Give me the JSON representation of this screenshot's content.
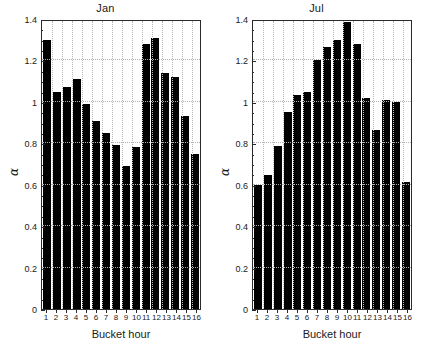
{
  "chart_data": [
    {
      "type": "bar",
      "title": "Jan",
      "xlabel": "Bucket hour",
      "ylabel": "α",
      "categories": [
        "1",
        "2",
        "3",
        "4",
        "5",
        "6",
        "7",
        "8",
        "9",
        "10",
        "11",
        "12",
        "13",
        "14",
        "15",
        "16"
      ],
      "values": [
        1.3,
        1.05,
        1.07,
        1.11,
        0.99,
        0.91,
        0.85,
        0.79,
        0.69,
        0.78,
        1.28,
        1.31,
        1.14,
        1.12,
        0.93,
        0.75
      ],
      "ylim": [
        0,
        1.4
      ],
      "yticks": [
        0,
        0.2,
        0.4,
        0.6,
        0.8,
        1,
        1.2,
        1.4
      ],
      "ytick_labels": [
        "0",
        "0.2",
        "0.4",
        "0.6",
        "0.8",
        "1",
        "1.2",
        "1.4"
      ],
      "grid": true,
      "legend": "none",
      "bar_color": "#000000"
    },
    {
      "type": "bar",
      "title": "Jul",
      "xlabel": "Bucket hour",
      "ylabel": "α",
      "categories": [
        "1",
        "2",
        "3",
        "4",
        "5",
        "6",
        "7",
        "8",
        "9",
        "10",
        "11",
        "12",
        "13",
        "14",
        "15",
        "16"
      ],
      "values": [
        0.6,
        0.645,
        0.785,
        0.95,
        1.035,
        1.05,
        1.2,
        1.265,
        1.3,
        1.385,
        1.28,
        1.02,
        0.865,
        1.01,
        1.0,
        0.615
      ],
      "ylim": [
        0,
        1.4
      ],
      "yticks": [
        0,
        0.2,
        0.4,
        0.6,
        0.8,
        1,
        1.2,
        1.4
      ],
      "ytick_labels": [
        "0",
        "0.2",
        "0.4",
        "0.6",
        "0.8",
        "1",
        "1.2",
        "1.4"
      ],
      "grid": true,
      "legend": "none",
      "bar_color": "#000000"
    }
  ]
}
